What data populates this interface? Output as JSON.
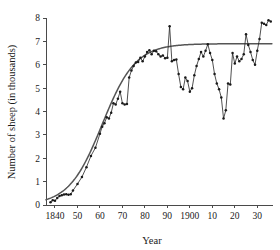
{
  "chart_data": {
    "type": "line",
    "title": "",
    "subtitle": "",
    "xlabel": "Year",
    "ylabel": "Number of sheep (in thousands)",
    "xlim": [
      1836,
      1937
    ],
    "ylim": [
      0,
      8
    ],
    "grid": false,
    "legend": null,
    "legend_position": "none",
    "x_tick_values": [
      1840,
      1850,
      1860,
      1870,
      1880,
      1890,
      1900,
      1910,
      1920,
      1930
    ],
    "x_tick_labels": [
      "1840",
      "50",
      "60",
      "70",
      "80",
      "90",
      "1900",
      "10",
      "20",
      "30"
    ],
    "y_tick_values": [
      0,
      1,
      2,
      3,
      4,
      5,
      6,
      7,
      8
    ],
    "y_tick_labels": [
      "0",
      "1",
      "2",
      "3",
      "4",
      "5",
      "6",
      "7",
      "8"
    ],
    "colors": {
      "observed_line": "#232323",
      "marker": "#1a1a1a",
      "fitted_curve": "#555555",
      "axis": "#4a4a4a",
      "background": "#ffffff"
    },
    "annotations": [],
    "series": [
      {
        "name": "Observed sheep population",
        "style": "line-with-markers",
        "x": [
          1838,
          1839,
          1840,
          1841,
          1842,
          1843,
          1844,
          1845,
          1846,
          1847,
          1848,
          1850,
          1852,
          1854,
          1856,
          1858,
          1860,
          1861,
          1862,
          1863,
          1864,
          1865,
          1866,
          1867,
          1868,
          1869,
          1870,
          1871,
          1872,
          1873,
          1874,
          1875,
          1876,
          1877,
          1878,
          1879,
          1880,
          1881,
          1882,
          1883,
          1884,
          1885,
          1886,
          1887,
          1888,
          1889,
          1890,
          1891,
          1892,
          1893,
          1894,
          1895,
          1896,
          1897,
          1898,
          1899,
          1900,
          1901,
          1902,
          1903,
          1904,
          1905,
          1906,
          1907,
          1908,
          1909,
          1910,
          1911,
          1912,
          1913,
          1914,
          1915,
          1916,
          1917,
          1918,
          1919,
          1920,
          1921,
          1922,
          1923,
          1924,
          1925,
          1926,
          1927,
          1928,
          1929,
          1930,
          1931,
          1932,
          1933,
          1934,
          1935,
          1936
        ],
        "y": [
          0.12,
          0.2,
          0.18,
          0.3,
          0.38,
          0.42,
          0.45,
          0.46,
          0.44,
          0.46,
          0.62,
          0.9,
          1.2,
          1.62,
          2.1,
          2.45,
          3.05,
          3.35,
          3.5,
          3.75,
          3.7,
          3.95,
          4.35,
          4.3,
          4.55,
          4.85,
          4.35,
          4.3,
          4.32,
          5.45,
          5.75,
          5.95,
          6.1,
          6.12,
          6.3,
          6.15,
          6.35,
          6.55,
          6.62,
          6.45,
          6.6,
          6.58,
          6.45,
          6.35,
          6.4,
          6.28,
          6.3,
          7.65,
          6.15,
          6.2,
          6.22,
          5.6,
          5.05,
          4.95,
          5.45,
          5.3,
          4.85,
          5.0,
          5.55,
          5.95,
          6.25,
          6.55,
          6.35,
          6.6,
          6.88,
          6.5,
          6.2,
          5.6,
          5.2,
          4.95,
          4.6,
          3.7,
          4.05,
          5.2,
          5.15,
          6.5,
          6.05,
          6.35,
          6.15,
          6.25,
          6.45,
          7.3,
          6.85,
          6.55,
          6.2,
          6.0,
          6.6,
          7.1,
          7.8,
          7.75,
          7.7,
          7.9,
          7.85
        ]
      },
      {
        "name": "Fitted logistic curve",
        "style": "smooth-line",
        "asymptote": 6.9,
        "midpoint_year": 1861,
        "growth_rate": 0.135
      }
    ]
  }
}
